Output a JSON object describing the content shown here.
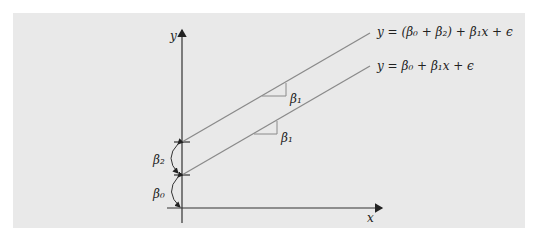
{
  "diagram": {
    "background_color": "#e9e9e9",
    "axis_color": "#333333",
    "line_color": "#8a8a8a",
    "axes": {
      "x_label": "x",
      "y_label": "y"
    },
    "lines": [
      {
        "name": "shifted-line",
        "equation": "y = (β₀ + β₂) + β₁x + ϵ",
        "slope_label": "β₁"
      },
      {
        "name": "base-line",
        "equation": "y = β₀ + β₁x + ϵ",
        "slope_label": "β₁"
      }
    ],
    "intercept_labels": {
      "offset": "β₂",
      "intercept": "β₀"
    }
  }
}
